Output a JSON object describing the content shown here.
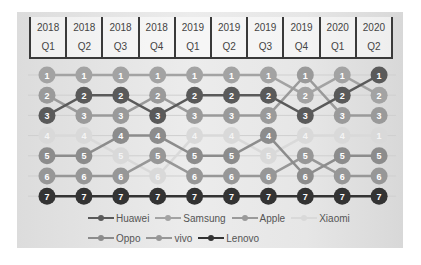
{
  "chart_data": {
    "type": "line",
    "title": "",
    "xlabel": "",
    "ylabel": "Rank",
    "y_inverted": true,
    "ylim": [
      1,
      7
    ],
    "legend_position": "bottom",
    "grid": true,
    "categories": [
      {
        "year": "2018",
        "quarter": "Q1"
      },
      {
        "year": "2018",
        "quarter": "Q2"
      },
      {
        "year": "2018",
        "quarter": "Q3"
      },
      {
        "year": "2018",
        "quarter": "Q4"
      },
      {
        "year": "2019",
        "quarter": "Q1"
      },
      {
        "year": "2019",
        "quarter": "Q2"
      },
      {
        "year": "2019",
        "quarter": "Q3"
      },
      {
        "year": "2019",
        "quarter": "Q4"
      },
      {
        "year": "2020",
        "quarter": "Q1"
      },
      {
        "year": "2020",
        "quarter": "Q2"
      }
    ],
    "series": [
      {
        "name": "Huawei",
        "color": "#5a5a5a",
        "values": [
          3,
          2,
          2,
          3,
          2,
          2,
          2,
          3,
          2,
          1
        ]
      },
      {
        "name": "Samsung",
        "color": "#a3a3a3",
        "values": [
          1,
          1,
          1,
          1,
          1,
          1,
          1,
          2,
          1,
          2
        ]
      },
      {
        "name": "Apple",
        "color": "#9a9a9a",
        "values": [
          2,
          3,
          3,
          2,
          3,
          3,
          3,
          1,
          3,
          3
        ]
      },
      {
        "name": "Xiaomi",
        "color": "#d9d9d9",
        "values": [
          4,
          4,
          5,
          6,
          4,
          4,
          5,
          4,
          4,
          4
        ]
      },
      {
        "name": "Oppo",
        "color": "#8c8c8c",
        "values": [
          5,
          5,
          4,
          4,
          5,
          5,
          4,
          6,
          5,
          5
        ]
      },
      {
        "name": "vivo",
        "color": "#979797",
        "values": [
          6,
          6,
          6,
          5,
          6,
          6,
          6,
          5,
          6,
          6
        ]
      },
      {
        "name": "Lenovo",
        "color": "#333333",
        "values": [
          7,
          7,
          7,
          7,
          7,
          7,
          7,
          7,
          7,
          7
        ]
      }
    ],
    "point_labels_note": "Each marker shows its rank number; the 2020 Q2 Xiaomi marker is labeled '1' in the image.",
    "label_overrides": [
      {
        "series": "Xiaomi",
        "index": 9,
        "label": "1"
      }
    ]
  },
  "legend": {
    "row1": [
      "Huawei",
      "Samsung",
      "Apple",
      "Xiaomi"
    ],
    "row2": [
      "Oppo",
      "vivo",
      "Lenovo"
    ]
  }
}
